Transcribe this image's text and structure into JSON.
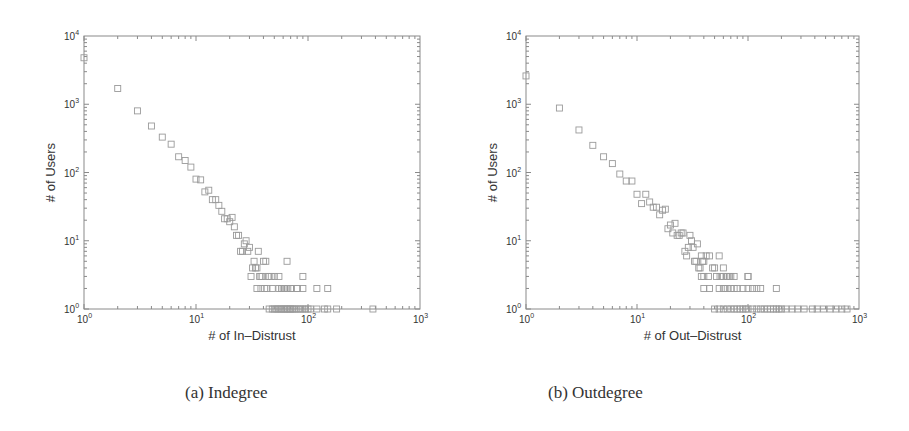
{
  "chart_data": [
    {
      "type": "scatter",
      "title": "",
      "caption": "(a)  Indegree",
      "xlabel": "# of In–Distrust",
      "ylabel": "# of Users",
      "xscale": "log",
      "yscale": "log",
      "xlim": [
        1,
        1000
      ],
      "ylim": [
        1,
        10000
      ],
      "xticks": [
        "10^0",
        "10^1",
        "10^2",
        "10^3"
      ],
      "yticks": [
        "10^0",
        "10^1",
        "10^2",
        "10^3",
        "10^4"
      ],
      "marker": "square-open",
      "grid": false,
      "x": [
        1,
        2,
        3,
        4,
        5,
        6,
        7,
        8,
        9,
        10,
        11,
        12,
        13,
        14,
        15,
        16,
        17,
        18,
        19,
        20,
        21,
        22,
        23,
        24,
        25,
        26,
        27,
        28,
        29,
        30,
        31,
        32,
        33,
        34,
        35,
        36,
        37,
        38,
        39,
        40,
        42,
        44,
        45,
        47,
        50,
        55,
        60,
        62,
        65,
        70,
        80,
        90,
        35,
        38,
        41,
        43,
        48,
        55,
        58,
        62,
        64,
        66,
        70,
        80,
        90,
        45,
        48,
        50,
        52,
        54,
        56,
        58,
        60,
        62,
        64,
        66,
        68,
        70,
        72,
        75,
        78,
        82,
        86,
        90,
        95,
        100,
        105,
        120,
        140,
        150,
        180,
        380,
        120,
        150
      ],
      "y": [
        4800,
        1700,
        800,
        480,
        330,
        260,
        170,
        150,
        120,
        80,
        78,
        52,
        55,
        40,
        40,
        33,
        27,
        21,
        21,
        19,
        22,
        16,
        12,
        12,
        7,
        7,
        9,
        10,
        7,
        8,
        3,
        4,
        5,
        4,
        4,
        7,
        3,
        3,
        3,
        5,
        5,
        3,
        3,
        3,
        3,
        3,
        2,
        2,
        5,
        2,
        2,
        3,
        2,
        2,
        2,
        2,
        2,
        2,
        2,
        2,
        2,
        2,
        2,
        2,
        2,
        1,
        1,
        1,
        1,
        1,
        1,
        1,
        1,
        1,
        1,
        1,
        1,
        1,
        1,
        1,
        1,
        1,
        1,
        1,
        1,
        1,
        1,
        1,
        1,
        1,
        1,
        1,
        2,
        2
      ]
    },
    {
      "type": "scatter",
      "title": "",
      "caption": "(b)  Outdegree",
      "xlabel": "# of Out–Distrust",
      "ylabel": "# of Users",
      "xscale": "log",
      "yscale": "log",
      "xlim": [
        1,
        1000
      ],
      "ylim": [
        1,
        10000
      ],
      "xticks": [
        "10^0",
        "10^1",
        "10^2",
        "10^3"
      ],
      "yticks": [
        "10^0",
        "10^1",
        "10^2",
        "10^3",
        "10^4"
      ],
      "marker": "square-open",
      "grid": false,
      "x": [
        1,
        2,
        3,
        4,
        5,
        6,
        7,
        8,
        9,
        10,
        11,
        12,
        13,
        14,
        15,
        16,
        17,
        18,
        19,
        20,
        21,
        22,
        23,
        24,
        25,
        26,
        27,
        28,
        29,
        30,
        31,
        32,
        33,
        34,
        35,
        36,
        37,
        38,
        39,
        40,
        42,
        45,
        48,
        50,
        55,
        58,
        60,
        65,
        70,
        75,
        100,
        40,
        45,
        55,
        60,
        62,
        65,
        70,
        75,
        80,
        90,
        100,
        110,
        120,
        130,
        180,
        38,
        40,
        44,
        52,
        56,
        60,
        64,
        68,
        100,
        50,
        55,
        60,
        65,
        70,
        75,
        80,
        85,
        90,
        95,
        100,
        110,
        120,
        130,
        140,
        150,
        160,
        170,
        180,
        190,
        200,
        220,
        250,
        280,
        320,
        380,
        420,
        480,
        550,
        620,
        700,
        780
      ],
      "y": [
        2600,
        880,
        420,
        250,
        170,
        135,
        95,
        75,
        75,
        48,
        35,
        48,
        37,
        31,
        31,
        24,
        28,
        29,
        15,
        17,
        13,
        18,
        12,
        12,
        13,
        13,
        7,
        6,
        8,
        12,
        10,
        8,
        5,
        5,
        9,
        4,
        4,
        6,
        5,
        5,
        6,
        6,
        4,
        4,
        6,
        3,
        4,
        3,
        3,
        3,
        3,
        2,
        2,
        2,
        2,
        2,
        2,
        2,
        2,
        2,
        2,
        2,
        2,
        2,
        2,
        2,
        3,
        3,
        3,
        3,
        3,
        3,
        3,
        3,
        3,
        1,
        1,
        1,
        1,
        1,
        1,
        1,
        1,
        1,
        1,
        1,
        1,
        1,
        1,
        1,
        1,
        1,
        1,
        1,
        1,
        1,
        1,
        1,
        1,
        1,
        1,
        1,
        1,
        1,
        1,
        1,
        1
      ]
    }
  ],
  "panels": {
    "a": {
      "caption": "(a)  Indegree",
      "xlabel": "# of In–Distrust",
      "ylabel": "# of Users"
    },
    "b": {
      "caption": "(b)  Outdegree",
      "xlabel": "# of Out–Distrust",
      "ylabel": "# of Users"
    }
  },
  "style": {
    "axis_color": "#8a8a8a",
    "marker_color": "#9a9a9a",
    "text_color": "#333333"
  }
}
